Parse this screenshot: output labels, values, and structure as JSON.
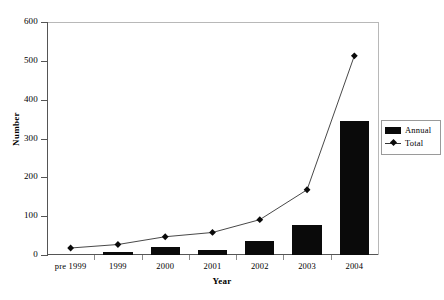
{
  "chart_data": {
    "type": "bar",
    "title": "",
    "xlabel": "Year",
    "ylabel": "Number",
    "categories": [
      "pre 1999",
      "1999",
      "2000",
      "2001",
      "2002",
      "2003",
      "2004"
    ],
    "ylim": [
      0,
      600
    ],
    "yticks": [
      0,
      100,
      200,
      300,
      400,
      500,
      600
    ],
    "ytick_labels": [
      "0",
      "100",
      "200",
      "300",
      "400",
      "500",
      "600"
    ],
    "grid": false,
    "legend_position": "right",
    "series": [
      {
        "name": "Annual",
        "type": "bar",
        "color": "#0a0a0a",
        "values": [
          0,
          8,
          20,
          13,
          35,
          77,
          345
        ]
      },
      {
        "name": "Total",
        "type": "line",
        "color": "#333333",
        "marker": "diamond",
        "values": [
          18,
          27,
          47,
          58,
          91,
          168,
          513
        ]
      }
    ]
  },
  "legend": {
    "items": [
      {
        "label": "Annual",
        "swatch": "bar-swatch"
      },
      {
        "label": "Total",
        "swatch": "line-marker-swatch"
      }
    ]
  }
}
